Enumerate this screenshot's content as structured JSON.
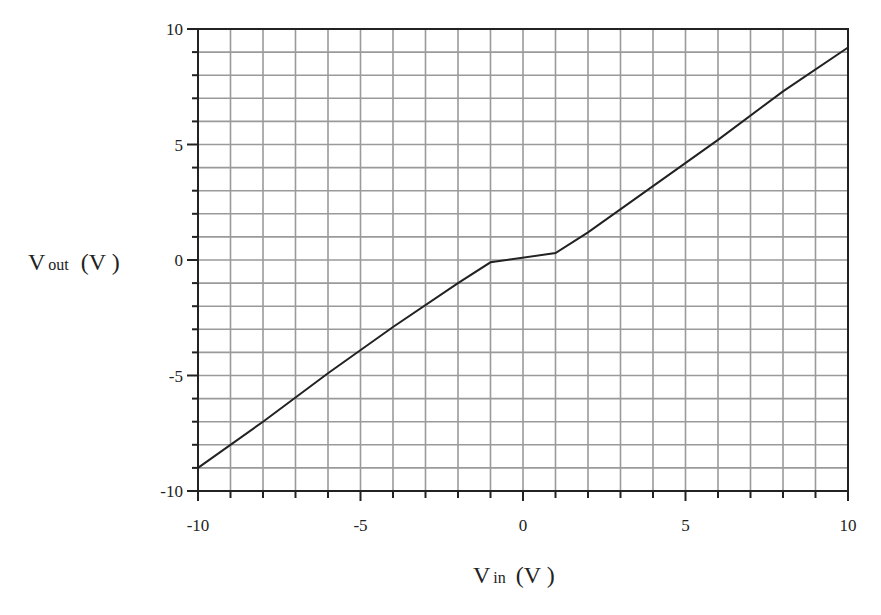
{
  "chart_data": {
    "type": "line",
    "title": "",
    "xlabel": "V_in (V)",
    "ylabel": "V_out (V)",
    "xlabel_parts": {
      "main": "V",
      "sub": "in",
      "unit": "(V )"
    },
    "ylabel_parts": {
      "main": "V",
      "sub": "out",
      "unit": "(V )"
    },
    "xlim": [
      -10,
      10
    ],
    "ylim": [
      -10,
      10
    ],
    "x_ticks": [
      -10,
      -5,
      0,
      5,
      10
    ],
    "y_ticks": [
      -10,
      -5,
      0,
      5,
      10
    ],
    "x_tick_labels": [
      "-10",
      "-5",
      "0",
      "5",
      "10"
    ],
    "y_tick_labels": [
      "-10",
      "-5",
      "0",
      "5",
      "10"
    ],
    "grid": true,
    "grid_step": 1,
    "legend": null,
    "series": [
      {
        "name": "Vout",
        "x": [
          -10,
          -8,
          -6,
          -4,
          -2,
          -1,
          1,
          2,
          4,
          6,
          8,
          10
        ],
        "values": [
          -9.0,
          -7.0,
          -4.9,
          -2.9,
          -1.0,
          -0.1,
          0.3,
          1.2,
          3.2,
          5.2,
          7.3,
          9.2
        ]
      }
    ]
  },
  "colors": {
    "grid": "#9a9a9a",
    "axis": "#222222",
    "line": "#222222",
    "background": "#ffffff"
  }
}
